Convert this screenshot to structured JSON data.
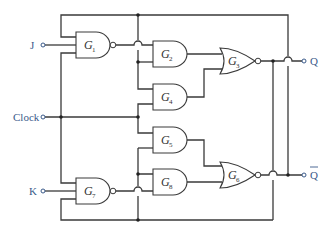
{
  "diagram": {
    "inputs": [
      {
        "id": "J",
        "label": "J"
      },
      {
        "id": "Clock",
        "label": "Clock"
      },
      {
        "id": "K",
        "label": "K"
      }
    ],
    "outputs": [
      {
        "id": "Q",
        "label": "Q"
      },
      {
        "id": "Qbar",
        "label": "Q",
        "overbar": true
      }
    ],
    "gates": [
      {
        "id": "G1",
        "letter": "G",
        "sub": "1",
        "type": "NAND"
      },
      {
        "id": "G2",
        "letter": "G",
        "sub": "2",
        "type": "AND"
      },
      {
        "id": "G3",
        "letter": "G",
        "sub": "3",
        "type": "NOR"
      },
      {
        "id": "G4",
        "letter": "G",
        "sub": "4",
        "type": "AND"
      },
      {
        "id": "G5",
        "letter": "G",
        "sub": "5",
        "type": "AND"
      },
      {
        "id": "G6",
        "letter": "G",
        "sub": "6",
        "type": "NOR"
      },
      {
        "id": "G7",
        "letter": "G",
        "sub": "7",
        "type": "NAND"
      },
      {
        "id": "G8",
        "letter": "G",
        "sub": "8",
        "type": "AND"
      }
    ],
    "colors": {
      "wire": "#3a3a3a",
      "io_label": "#3a5a8a"
    }
  }
}
